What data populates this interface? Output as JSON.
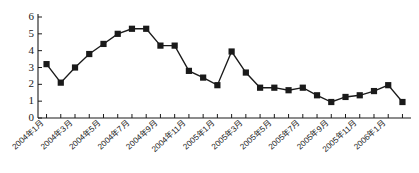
{
  "chart_data": {
    "type": "line",
    "title": "",
    "subtitle": "",
    "xlabel": "",
    "ylabel": "",
    "ylim": [
      0,
      6
    ],
    "yticks": [
      0,
      1,
      2,
      3,
      4,
      5,
      6
    ],
    "grid": false,
    "legend": false,
    "marker": "square",
    "line_color": "#1a1a1a",
    "marker_color": "#1a1a1a",
    "categories": [
      "2004年1月",
      "2004年2月",
      "2004年3月",
      "2004年4月",
      "2004年5月",
      "2004年6月",
      "2004年7月",
      "2004年8月",
      "2004年9月",
      "2004年10月",
      "2004年11月",
      "2004年12月",
      "2005年1月",
      "2005年2月",
      "2005年3月",
      "2005年4月",
      "2005年5月",
      "2005年6月",
      "2005年7月",
      "2005年8月",
      "2005年9月",
      "2005年10月",
      "2005年11月",
      "2005年12月",
      "2006年1月",
      "2006年2月"
    ],
    "values": [
      3.2,
      2.1,
      3.0,
      3.8,
      4.4,
      5.0,
      5.3,
      5.3,
      4.3,
      4.3,
      2.8,
      2.4,
      1.95,
      3.95,
      2.7,
      1.8,
      1.8,
      1.65,
      1.8,
      1.35,
      0.95,
      1.25,
      1.35,
      1.6,
      1.95,
      0.95
    ],
    "xtick_labels": [
      "2004年1月",
      "2004年3月",
      "2004年5月",
      "2004年7月",
      "2004年9月",
      "2004年11月",
      "2005年1月",
      "2005年3月",
      "2005年5月",
      "2005年7月",
      "2005年9月",
      "2005年11月",
      "2006年1月"
    ],
    "xtick_indices": [
      0,
      2,
      4,
      6,
      8,
      10,
      12,
      14,
      16,
      18,
      20,
      22,
      24
    ]
  }
}
